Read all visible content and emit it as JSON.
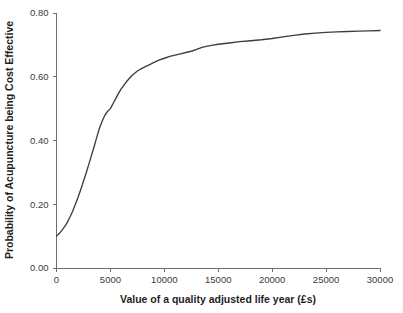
{
  "chart_data": {
    "type": "line",
    "title": "",
    "subtitle": "",
    "xlabel": "Value of a quality adjusted life year (£s)",
    "ylabel": "Probability of Acupuncture being Cost Effective",
    "xlim": [
      0,
      30000
    ],
    "ylim": [
      0.0,
      0.8
    ],
    "grid": false,
    "legend": false,
    "legend_position": "none",
    "line_color": "#3d3d3d",
    "axis_color": "#6e6e6e",
    "background_color": "#ffffff",
    "xticks": [
      0,
      5000,
      10000,
      15000,
      20000,
      25000,
      30000
    ],
    "xtick_labels": [
      "0",
      "5000",
      "10000",
      "15000",
      "20000",
      "25000",
      "30000"
    ],
    "yticks": [
      0.0,
      0.2,
      0.4,
      0.6,
      0.8
    ],
    "ytick_labels": [
      "0.00",
      "0.20",
      "0.40",
      "0.60",
      "0.80"
    ],
    "series": [
      {
        "name": "Cost-effectiveness acceptability curve",
        "x": [
          0,
          250,
          500,
          750,
          1000,
          1250,
          1500,
          1750,
          2000,
          2250,
          2500,
          2750,
          3000,
          3250,
          3500,
          3750,
          4000,
          4250,
          4500,
          4750,
          5000,
          5250,
          5500,
          5750,
          6000,
          6500,
          7000,
          7500,
          8000,
          8500,
          9000,
          9500,
          10000,
          10500,
          11000,
          11500,
          12000,
          12500,
          13000,
          13500,
          14000,
          14500,
          15000,
          16000,
          17000,
          18000,
          19000,
          20000,
          21000,
          22000,
          23000,
          24000,
          25000,
          26000,
          27000,
          28000,
          29000,
          30000
        ],
        "y": [
          0.1,
          0.108,
          0.118,
          0.13,
          0.143,
          0.16,
          0.178,
          0.2,
          0.222,
          0.246,
          0.272,
          0.298,
          0.326,
          0.354,
          0.382,
          0.412,
          0.44,
          0.462,
          0.48,
          0.492,
          0.5,
          0.516,
          0.532,
          0.548,
          0.562,
          0.585,
          0.604,
          0.618,
          0.628,
          0.636,
          0.644,
          0.652,
          0.658,
          0.664,
          0.668,
          0.672,
          0.676,
          0.68,
          0.686,
          0.692,
          0.696,
          0.699,
          0.702,
          0.706,
          0.71,
          0.713,
          0.716,
          0.72,
          0.725,
          0.73,
          0.734,
          0.737,
          0.739,
          0.741,
          0.742,
          0.743,
          0.744,
          0.745
        ]
      }
    ],
    "annotations": []
  }
}
